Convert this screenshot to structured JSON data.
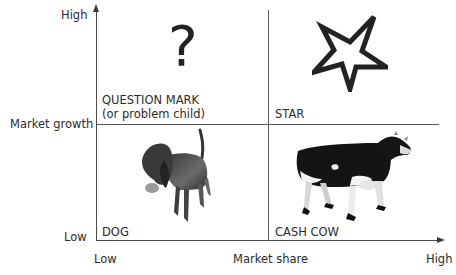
{
  "diagram": {
    "type": "bcg-matrix",
    "y_axis": {
      "label": "Market growth",
      "high": "High",
      "low": "Low"
    },
    "x_axis": {
      "label": "Market share",
      "high": "High",
      "low": "Low"
    },
    "quadrants": [
      {
        "position": "top-left",
        "title": "QUESTION MARK",
        "subtitle": "(or problem child)",
        "icon": "question-mark-icon",
        "glyph": "?"
      },
      {
        "position": "top-right",
        "title": "STAR",
        "icon": "star-icon"
      },
      {
        "position": "bottom-left",
        "title": "DOG",
        "icon": "dog-image"
      },
      {
        "position": "bottom-right",
        "title": "CASH COW",
        "icon": "cow-image"
      }
    ],
    "colors": {
      "line": "#4a4a4a",
      "text": "#2b2b2b",
      "background": "#ffffff"
    }
  }
}
